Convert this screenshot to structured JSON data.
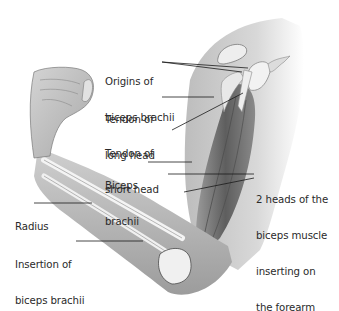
{
  "figure": {
    "colors": {
      "background": "#ffffff",
      "skin_light": "#e6e6e6",
      "skin_mid": "#bdbdbd",
      "skin_dark": "#7a7a7a",
      "muscle": "#6e6e6e",
      "bone": "#f2f2f2",
      "leader_line": "#1a1a1a",
      "text": "#2a2a2a"
    },
    "labels": [
      {
        "id": "origins",
        "lines": [
          "Origins of",
          "biceps brachii"
        ]
      },
      {
        "id": "tendon-long",
        "lines": [
          "Tendon of",
          "long head"
        ]
      },
      {
        "id": "tendon-short",
        "lines": [
          "Tendon of",
          "short head"
        ]
      },
      {
        "id": "biceps",
        "lines": [
          "Biceps",
          "brachii"
        ]
      },
      {
        "id": "two-heads",
        "lines": [
          "2 heads of the",
          "biceps muscle",
          "inserting on",
          "the forearm"
        ]
      },
      {
        "id": "radius",
        "lines": [
          "Radius"
        ]
      },
      {
        "id": "insertion",
        "lines": [
          "Insertion of",
          "biceps brachii"
        ]
      }
    ]
  }
}
